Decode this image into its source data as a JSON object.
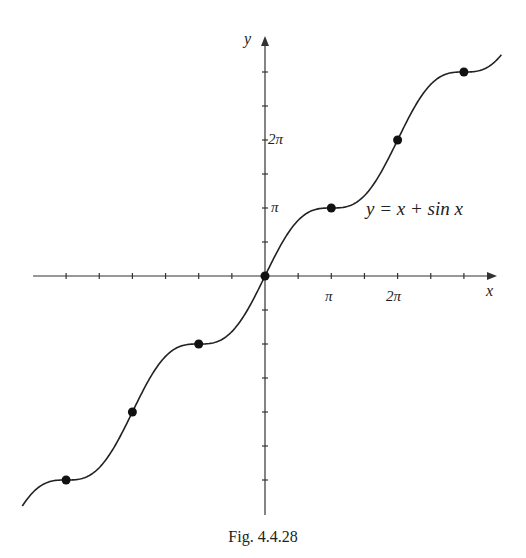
{
  "chart_data": {
    "type": "line",
    "title": "",
    "function": "y = x + sin x",
    "curve_label": "y = x + sin x",
    "xlabel": "x",
    "ylabel": "y",
    "x_tick_labels": [
      "π",
      "2π"
    ],
    "y_tick_labels": [
      "π",
      "2π"
    ],
    "x_tick_spacing": "π/2",
    "y_tick_spacing": "π/2",
    "xlim": [
      -11.5,
      11.2
    ],
    "ylim": [
      -11.3,
      11.3
    ],
    "grid": false,
    "marked_points": [
      {
        "x": "-3π",
        "y": "-3π"
      },
      {
        "x": "-2π",
        "y": "-2π"
      },
      {
        "x": "-π",
        "y": "-π"
      },
      {
        "x": "0",
        "y": "0"
      },
      {
        "x": "π",
        "y": "π"
      },
      {
        "x": "2π",
        "y": "2π"
      },
      {
        "x": "3π",
        "y": "3π"
      }
    ]
  },
  "labels": {
    "x_axis": "x",
    "y_axis": "y",
    "x_pi": "π",
    "x_2pi": "2π",
    "y_pi": "π",
    "y_2pi": "2π",
    "curve": "y = x + sin x"
  },
  "caption": "Fig.  4.4.28"
}
